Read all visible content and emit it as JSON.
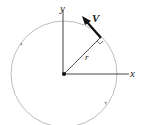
{
  "diagram": {
    "labels": {
      "x_axis": "x",
      "y_axis": "y",
      "radius": "r",
      "velocity": "V"
    },
    "colors": {
      "circle": "#b0b0b0",
      "axes": "#444444",
      "vector": "#111111"
    }
  }
}
